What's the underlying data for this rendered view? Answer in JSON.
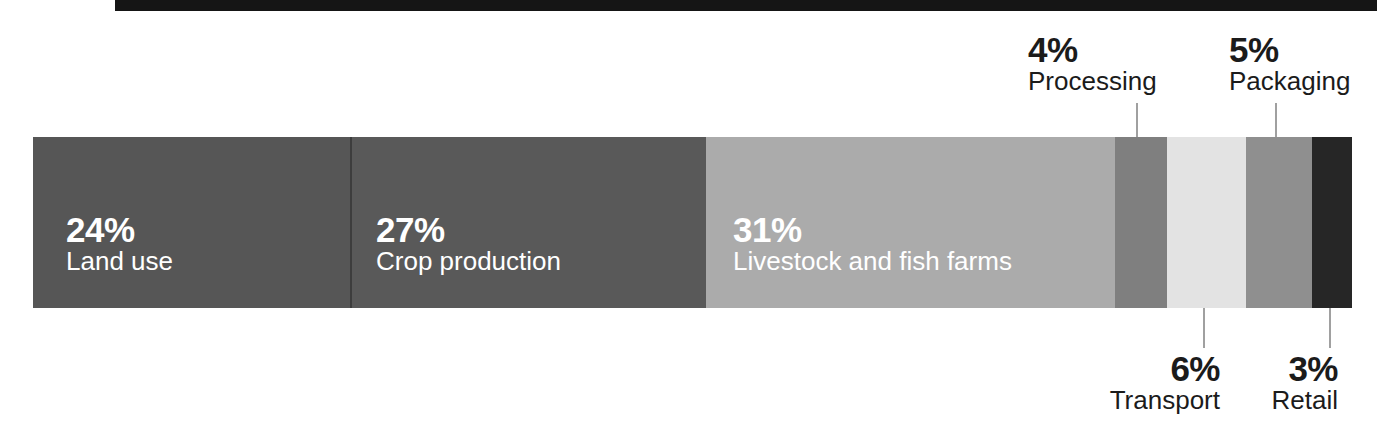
{
  "chart_data": {
    "type": "bar",
    "variant": "single-horizontal-stacked",
    "title": "",
    "unit": "%",
    "total": 100,
    "axes": "none",
    "grid": false,
    "legend_position": "none",
    "segments": [
      {
        "label": "Land use",
        "value": 24,
        "percent_label": "24%",
        "color": "#565656",
        "text_color": "#ffffff",
        "label_placement": "inside"
      },
      {
        "label": "Crop production",
        "value": 27,
        "percent_label": "27%",
        "color": "#595959",
        "text_color": "#ffffff",
        "label_placement": "inside"
      },
      {
        "label": "Livestock and fish farms",
        "value": 31,
        "percent_label": "31%",
        "color": "#ababab",
        "text_color": "#ffffff",
        "label_placement": "inside"
      },
      {
        "label": "Processing",
        "value": 4,
        "percent_label": "4%",
        "color": "#7f7f7f",
        "text_color": "#1b1b1b",
        "label_placement": "above"
      },
      {
        "label": "Transport",
        "value": 6,
        "percent_label": "6%",
        "color": "#e3e3e3",
        "text_color": "#1b1b1b",
        "label_placement": "below"
      },
      {
        "label": "Packaging",
        "value": 5,
        "percent_label": "5%",
        "color": "#8f8f8f",
        "text_color": "#1b1b1b",
        "label_placement": "above"
      },
      {
        "label": "Retail",
        "value": 3,
        "percent_label": "3%",
        "color": "#262626",
        "text_color": "#1b1b1b",
        "label_placement": "below"
      }
    ]
  },
  "colors": {
    "background": "#ffffff",
    "callout_text": "#1b1b1b",
    "leader_line": "#a0a0a0",
    "segment_divider": "#3d3d3d",
    "top_strip": "#151515"
  }
}
